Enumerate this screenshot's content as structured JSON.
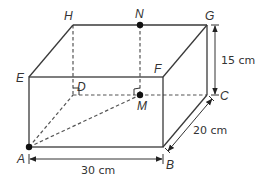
{
  "diagram": {
    "type": "cuboid",
    "vertices": {
      "A": {
        "label": "A",
        "x": 29,
        "y": 147
      },
      "B": {
        "label": "B",
        "x": 163,
        "y": 147
      },
      "C": {
        "label": "C",
        "x": 207,
        "y": 95
      },
      "D": {
        "label": "D",
        "x": 73,
        "y": 95
      },
      "E": {
        "label": "E",
        "x": 29,
        "y": 77
      },
      "F": {
        "label": "F",
        "x": 163,
        "y": 77
      },
      "G": {
        "label": "G",
        "x": 207,
        "y": 25
      },
      "H": {
        "label": "H",
        "x": 73,
        "y": 25
      }
    },
    "points": {
      "N": {
        "label": "N",
        "x": 140,
        "y": 25
      },
      "M": {
        "label": "M",
        "x": 140,
        "y": 95
      }
    },
    "dimensions": {
      "length": "30 cm",
      "width": "20 cm",
      "height": "15 cm"
    },
    "colors": {
      "line": "#3a3a3a",
      "text": "#333333"
    }
  }
}
